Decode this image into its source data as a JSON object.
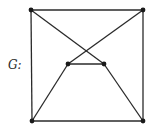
{
  "diagram": {
    "type": "graph",
    "label": "G:",
    "colors": {
      "edge": "#2a2a2a",
      "vertex": "#1a1a1a",
      "background": "#ffffff"
    },
    "vertices": [
      {
        "id": "v1",
        "name": "top-left",
        "x": 31,
        "y": 10
      },
      {
        "id": "v2",
        "name": "top-right",
        "x": 143,
        "y": 10
      },
      {
        "id": "v3",
        "name": "bottom-left",
        "x": 32,
        "y": 121
      },
      {
        "id": "v4",
        "name": "bottom-right",
        "x": 143,
        "y": 121
      },
      {
        "id": "v5",
        "name": "inner-left",
        "x": 68,
        "y": 64
      },
      {
        "id": "v6",
        "name": "inner-right",
        "x": 104,
        "y": 64
      }
    ],
    "edges": [
      {
        "from": "v1",
        "to": "v2"
      },
      {
        "from": "v1",
        "to": "v3"
      },
      {
        "from": "v2",
        "to": "v4"
      },
      {
        "from": "v3",
        "to": "v4"
      },
      {
        "from": "v1",
        "to": "v6"
      },
      {
        "from": "v2",
        "to": "v5"
      },
      {
        "from": "v5",
        "to": "v6"
      },
      {
        "from": "v5",
        "to": "v3"
      },
      {
        "from": "v6",
        "to": "v4"
      }
    ]
  }
}
